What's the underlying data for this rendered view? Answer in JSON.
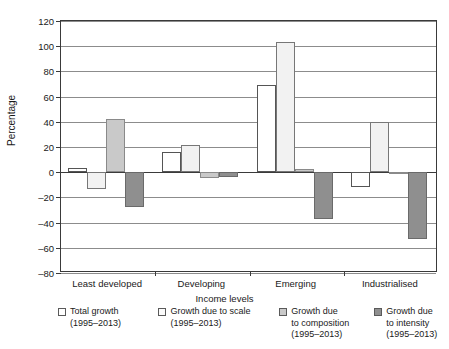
{
  "chart_data": {
    "type": "bar",
    "title": "",
    "subtitle": "",
    "xlabel": "Income levels",
    "ylabel": "Percentage",
    "categories": [
      "Least developed",
      "Developing",
      "Emerging",
      "Industrialised"
    ],
    "ylim": [
      -80,
      120
    ],
    "ytick_step": 20,
    "yticks": [
      120,
      100,
      80,
      60,
      40,
      20,
      0,
      -20,
      -40,
      -60,
      -80
    ],
    "ytick_labels": [
      "120",
      "100",
      "80",
      "60",
      "40",
      "20",
      "0",
      "–20",
      "–40",
      "–60",
      "–80"
    ],
    "grid": true,
    "grid_axis": "y",
    "legend_position": "bottom",
    "series": [
      {
        "name": "Total growth (1995–2013)",
        "key": "total",
        "color": "#ffffff",
        "edge_color": "#555555",
        "values": [
          3,
          16,
          69,
          -12
        ]
      },
      {
        "name": "Growth due to scale (1995–2013)",
        "key": "scale",
        "color": "#f2f2f2",
        "edge_color": "#777777",
        "values": [
          -13,
          21.5,
          103.5,
          40
        ]
      },
      {
        "name": "Growth due to composition (1995–2013)",
        "key": "composition",
        "color": "#c9c9c9",
        "edge_color": "#8a8a8a",
        "values": [
          42,
          -5,
          2.5,
          -0.5
        ]
      },
      {
        "name": "Growth due to intensity (1995–2013)",
        "key": "intensity",
        "color": "#8f8f8f",
        "edge_color": "#6a6a6a",
        "values": [
          -28,
          -4,
          -37,
          -53
        ]
      }
    ]
  },
  "axis": {
    "y_title": "Percentage",
    "x_title": "Income levels",
    "y_labels": [
      "120",
      "100",
      "80",
      "60",
      "40",
      "20",
      "0",
      "–20",
      "–40",
      "–60",
      "–80"
    ],
    "x_labels": [
      "Least developed",
      "Developing",
      "Emerging",
      "Industrialised"
    ]
  },
  "legend": {
    "items": [
      {
        "label": "Total growth\n(1995–2013)",
        "swatch": "s-total"
      },
      {
        "label": "Growth due to scale\n(1995–2013)",
        "swatch": "s-scale"
      },
      {
        "label": "Growth due\nto composition\n(1995–2013)",
        "swatch": "s-composition"
      },
      {
        "label": "Growth due\nto intensity\n(1995–2013)",
        "swatch": "s-intensity"
      }
    ]
  }
}
